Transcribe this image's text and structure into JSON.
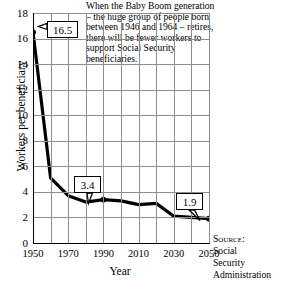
{
  "chart_data": {
    "type": "line",
    "title": "",
    "xlabel": "Year",
    "ylabel": "Workers per beneficiary",
    "xlim": [
      1950,
      2050
    ],
    "ylim": [
      0,
      18
    ],
    "grid": true,
    "legend": "none",
    "x": [
      1950,
      1960,
      1970,
      1980,
      1990,
      2000,
      2010,
      2020,
      2030,
      2040,
      2050
    ],
    "values": [
      16.5,
      5.1,
      3.7,
      3.2,
      3.4,
      3.3,
      3.0,
      3.1,
      2.1,
      2.0,
      1.9
    ],
    "series": [
      {
        "name": "Workers per Social Security beneficiary",
        "values": [
          16.5,
          5.1,
          3.7,
          3.2,
          3.4,
          3.3,
          3.0,
          3.1,
          2.1,
          2.0,
          1.9
        ]
      }
    ],
    "y_ticks": [
      "0",
      "2",
      "4",
      "6",
      "8",
      "10",
      "12",
      "14",
      "16",
      "18"
    ],
    "x_ticks": [
      "1950",
      "1970",
      "1990",
      "2010",
      "2030",
      "2050"
    ],
    "x_gridline_years": [
      1950,
      1960,
      1970,
      1980,
      1990,
      2000,
      2010,
      2020,
      2030,
      2040,
      2050
    ],
    "markers": [
      {
        "label": "16.5",
        "x": 1950,
        "y": 16.5
      },
      {
        "label": "3.4",
        "x": 1990,
        "y": 3.4
      },
      {
        "label": "1.9",
        "x": 2050,
        "y": 1.9
      }
    ],
    "annotations": [
      "When the Baby Boom generation",
      "– the huge group of people born",
      "between 1946 and 1964 – retires,",
      "there will be fewer workers  to",
      "support Social Security",
      "beneficiaries."
    ],
    "colors": {
      "line": "#000000",
      "grid": "#8d8d8d",
      "axis": "#000000",
      "background": "#ffffff"
    }
  },
  "callouts": {
    "first": "16.5",
    "middle": "3.4",
    "last": "1.9"
  },
  "source": {
    "label": "Source:",
    "line1": "Social",
    "line2": "Security",
    "line3": "Administration"
  }
}
